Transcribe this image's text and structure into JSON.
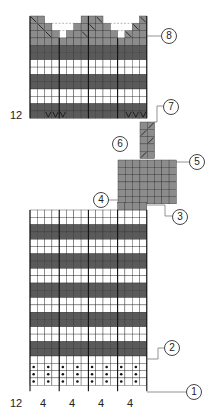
{
  "colors": {
    "dark": "#5a5a5a",
    "mid": "#8c8c8c",
    "light": "#ffffff",
    "grid": "#333333",
    "heavy_line": "#111111"
  },
  "cell": 7.3,
  "top_section": {
    "x": 30,
    "y": 16,
    "cols": 16,
    "rows": [
      "shape",
      "shape",
      "shape",
      "shape",
      "dark",
      "dark",
      "light",
      "light",
      "dark",
      "dark",
      "light",
      "light",
      "dark",
      "dark"
    ],
    "row_label": "12",
    "vmarks_cols": [
      2,
      3,
      4,
      13,
      14,
      15
    ]
  },
  "strip": {
    "x": 140,
    "y": 122,
    "cols": 2,
    "rows": 5
  },
  "grey_block": {
    "x": 118,
    "y": 160,
    "cols": 8,
    "rows": 6
  },
  "bottom_section": {
    "x": 30,
    "y": 210,
    "cols": 16,
    "rows": [
      "light",
      "light",
      "dark",
      "dark",
      "light",
      "light",
      "dark",
      "dark",
      "light",
      "light",
      "dark",
      "dark",
      "light",
      "light",
      "dark",
      "dark",
      "light",
      "light",
      "dark",
      "dark",
      "light",
      "dots",
      "dots",
      "dots"
    ],
    "row_label": "12",
    "col_group_labels": [
      "4",
      "4",
      "4",
      "4"
    ]
  },
  "callouts": [
    {
      "n": "1",
      "x": 186,
      "y": 385,
      "line_y": 392
    },
    {
      "n": "2",
      "x": 164,
      "y": 341,
      "line_y": 359
    },
    {
      "n": "3",
      "x": 172,
      "y": 210,
      "line_y": 204
    },
    {
      "n": "4",
      "x": 93,
      "y": 193,
      "line_y": 200
    },
    {
      "n": "5",
      "x": 189,
      "y": 155,
      "line_y": 162
    },
    {
      "n": "6",
      "x": 112,
      "y": 137,
      "line_y": null
    },
    {
      "n": "7",
      "x": 163,
      "y": 100,
      "line_y": 122
    },
    {
      "n": "8",
      "x": 161,
      "y": 29,
      "line_y": 36
    }
  ]
}
